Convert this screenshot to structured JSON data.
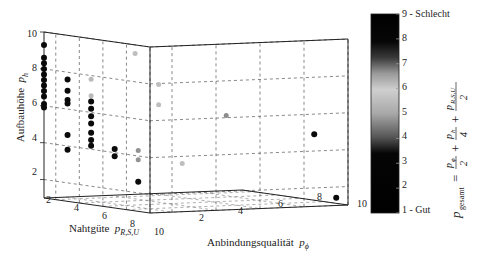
{
  "chart_data": {
    "type": "scatter3d",
    "title": "",
    "axes": {
      "x": {
        "label": "Nahtgüte",
        "symbol": "p_{R,S,U}",
        "ticks": [
          2,
          4,
          6,
          8,
          10
        ],
        "range": [
          1,
          10
        ]
      },
      "y": {
        "label": "Anbindungsqualität",
        "symbol": "p_ϕ",
        "ticks": [
          2,
          4,
          6,
          8,
          10
        ],
        "range": [
          1,
          10
        ]
      },
      "z": {
        "label": "Aufbauhöhe",
        "symbol": "p_h",
        "ticks": [
          2,
          4,
          6,
          8,
          10
        ],
        "range": [
          1,
          10
        ]
      }
    },
    "grid": true,
    "colorbar": {
      "label": "p_gesamt = p_ϕ/2 + p_h/4 + p_{R,S,U}/2",
      "ticks": [
        "1 - Gut",
        "2",
        "3",
        "4",
        "5",
        "6",
        "7",
        "8",
        "9 - Schlecht"
      ],
      "range": [
        1,
        9
      ],
      "colormap": "black-gray-white-gray-black (light around 5.5–6)"
    },
    "points": [
      {
        "x": 1,
        "y": 1,
        "z": 9.3,
        "c": 1.5
      },
      {
        "x": 1,
        "y": 1,
        "z": 8.6,
        "c": 1.5
      },
      {
        "x": 1,
        "y": 1,
        "z": 8.3,
        "c": 1.5
      },
      {
        "x": 1,
        "y": 1,
        "z": 8.0,
        "c": 1.5
      },
      {
        "x": 1,
        "y": 1,
        "z": 7.7,
        "c": 1.5
      },
      {
        "x": 1,
        "y": 1,
        "z": 7.4,
        "c": 1.5
      },
      {
        "x": 1,
        "y": 1,
        "z": 7.1,
        "c": 1.5
      },
      {
        "x": 1,
        "y": 1,
        "z": 6.8,
        "c": 1.5
      },
      {
        "x": 1,
        "y": 1,
        "z": 6.5,
        "c": 1.5
      },
      {
        "x": 1,
        "y": 1,
        "z": 6.1,
        "c": 1.5
      },
      {
        "x": 1,
        "y": 1,
        "z": 5.9,
        "c": 1.5
      },
      {
        "x": 3,
        "y": 1,
        "z": 7.6,
        "c": 2
      },
      {
        "x": 3,
        "y": 1,
        "z": 7.0,
        "c": 2
      },
      {
        "x": 3,
        "y": 1,
        "z": 6.5,
        "c": 2
      },
      {
        "x": 3,
        "y": 1,
        "z": 6.3,
        "c": 2
      },
      {
        "x": 3,
        "y": 1,
        "z": 4.6,
        "c": 2.5
      },
      {
        "x": 3,
        "y": 1,
        "z": 3.8,
        "c": 2.5
      },
      {
        "x": 5,
        "y": 1,
        "z": 7.8,
        "c": 5.5
      },
      {
        "x": 5,
        "y": 1,
        "z": 6.9,
        "c": 5.5
      },
      {
        "x": 5,
        "y": 1,
        "z": 6.6,
        "c": 3
      },
      {
        "x": 5,
        "y": 1,
        "z": 6.2,
        "c": 3
      },
      {
        "x": 5,
        "y": 1,
        "z": 5.8,
        "c": 3
      },
      {
        "x": 5,
        "y": 1,
        "z": 5.4,
        "c": 3
      },
      {
        "x": 5,
        "y": 1,
        "z": 4.9,
        "c": 2.5
      },
      {
        "x": 5,
        "y": 1,
        "z": 4.5,
        "c": 2.5
      },
      {
        "x": 5,
        "y": 1,
        "z": 4.2,
        "c": 2.5
      },
      {
        "x": 5,
        "y": 3,
        "z": 9.1,
        "c": 6
      },
      {
        "x": 7,
        "y": 1,
        "z": 4.2,
        "c": 3
      },
      {
        "x": 7,
        "y": 1,
        "z": 3.8,
        "c": 3
      },
      {
        "x": 7,
        "y": 3,
        "z": 7.6,
        "c": 6
      },
      {
        "x": 7,
        "y": 3,
        "z": 6.5,
        "c": 6
      },
      {
        "x": 9,
        "y": 1,
        "z": 4.3,
        "c": 5
      },
      {
        "x": 9,
        "y": 1,
        "z": 3.8,
        "c": 5
      },
      {
        "x": 9,
        "y": 1,
        "z": 2.6,
        "c": 2
      },
      {
        "x": 9,
        "y": 3,
        "z": 3.5,
        "c": 6
      },
      {
        "x": 9,
        "y": 5,
        "z": 6.0,
        "c": 6.5
      },
      {
        "x": 9,
        "y": 9,
        "z": 4.8,
        "c": 1.5
      },
      {
        "x": 9,
        "y": 10,
        "z": 1.3,
        "c": 1.5
      }
    ]
  },
  "labels": {
    "z_axis": "Aufbauhöhe",
    "z_symbol": "p",
    "z_sub": "h",
    "x_axis": "Nahtgüte",
    "x_symbol": "p",
    "x_sub": "R,S,U",
    "y_axis": "Anbindungsqualität",
    "y_symbol": "p",
    "y_sub": "ϕ",
    "z_ticks": [
      "10",
      "8",
      "6",
      "4",
      "2"
    ],
    "x_ticks": [
      "2",
      "4",
      "6",
      "8",
      "10"
    ],
    "y_ticks": [
      "2",
      "4",
      "6",
      "8",
      "10"
    ],
    "cb_ticks": [
      "9 - Schlecht",
      "8",
      "7",
      "6",
      "5",
      "4",
      "3",
      "2",
      "1 - Gut"
    ],
    "formula": "p_gesamt = p_ϕ/2 + p_h/4 + p_R,S,U/2"
  }
}
